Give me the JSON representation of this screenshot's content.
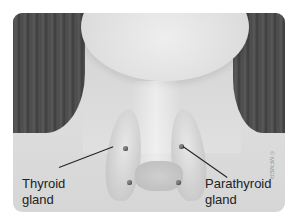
{
  "illustration": {
    "subject": "neck anatomy showing thyroid and parathyroid glands",
    "labels": {
      "thyroid_line1": "Thyroid",
      "thyroid_line2": "gland",
      "parathyroid_line1": "Parathyroid",
      "parathyroid_line2": "gland"
    },
    "copyright": "© MFMER",
    "colors": {
      "background": "#ffffff",
      "skin": "#d9d9d9",
      "hair": "#4a4a4a",
      "text": "#222222"
    }
  }
}
